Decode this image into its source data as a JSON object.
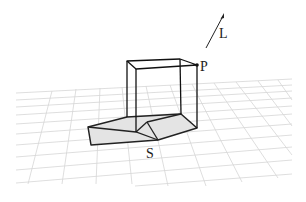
{
  "figure": {
    "labels": {
      "light": "L",
      "point": "P",
      "shadow": "S"
    },
    "colors": {
      "background": "#ffffff",
      "grid": "#d6d6d6",
      "edges": "#111111",
      "shadow_fill": "#e4e4e4"
    },
    "elements": [
      {
        "name": "light-direction-arrow",
        "label": "L"
      },
      {
        "name": "wireframe-cube"
      },
      {
        "name": "corner-point",
        "label": "P"
      },
      {
        "name": "cast-shadow",
        "label": "S"
      },
      {
        "name": "ground-grid"
      }
    ]
  }
}
